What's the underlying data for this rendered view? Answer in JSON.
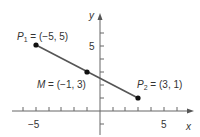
{
  "diagram": {
    "type": "coordinate-plane-midpoint",
    "axes": {
      "x_label": "x",
      "y_label": "y",
      "x_tick_label_neg": "−5",
      "x_tick_label_pos": "5",
      "y_tick_label": "5",
      "x_range": [
        -7,
        7
      ],
      "y_range": [
        -2,
        7
      ]
    },
    "points": [
      {
        "id": "P1",
        "name": "P",
        "sub": "1",
        "coords": "(−5, 5)",
        "x": -5,
        "y": 5,
        "eq": " = "
      },
      {
        "id": "M",
        "name": "M",
        "sub": "",
        "coords": "(−1, 3)",
        "x": -1,
        "y": 3,
        "eq": " = "
      },
      {
        "id": "P2",
        "name": "P",
        "sub": "2",
        "coords": "(3, 1)",
        "x": 3,
        "y": 1,
        "eq": " = "
      }
    ],
    "colors": {
      "axis": "#555555",
      "segment": "#555555",
      "point": "#111111",
      "text": "#333333"
    }
  }
}
